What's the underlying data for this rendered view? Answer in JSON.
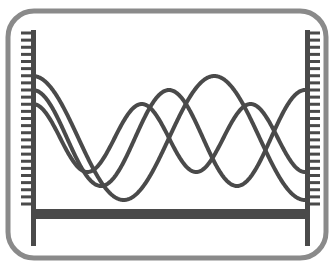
{
  "figure": {
    "title": "Standing wave modes between two fixed boundaries",
    "background_color": "#ffffff",
    "frame": {
      "name": "rounded-border-frame",
      "x": 8,
      "y": 11,
      "width": 318,
      "height": 247,
      "corner_radius": 26,
      "stroke_color": "#8a8a8a",
      "stroke_width": 5,
      "fill": "none"
    },
    "left_wall": {
      "label": "fixed boundary left",
      "bar_x": 31,
      "bar_top": 30,
      "bar_bottom": 246,
      "bar_width": 5,
      "color": "#4a4a4a",
      "hatch_side": "left",
      "hatch_count": 25,
      "hatch_length": 10,
      "hatch_thickness": 3,
      "hatch_top": 33,
      "hatch_bottom": 204
    },
    "right_wall": {
      "label": "fixed boundary right",
      "bar_x": 305,
      "bar_top": 30,
      "bar_bottom": 246,
      "bar_width": 5,
      "color": "#4a4a4a",
      "hatch_side": "right",
      "hatch_count": 25,
      "hatch_length": 10,
      "hatch_thickness": 3,
      "hatch_top": 33,
      "hatch_bottom": 204
    },
    "base_bar": {
      "label": "rigid base support",
      "x": 31,
      "y": 209,
      "width": 276,
      "height": 10,
      "color": "#4a4a4a"
    }
  },
  "chart_data": {
    "type": "line",
    "title": "Standing wave modes between two fixed boundaries",
    "xlabel": "",
    "ylabel": "",
    "xlim": [
      33,
      305
    ],
    "ylim": [
      70,
      210
    ],
    "grid": false,
    "legend": "none",
    "baseline_y": 138,
    "stroke_color": "#4a4a4a",
    "stroke_width": 4,
    "series": [
      {
        "name": "mode-1-three-half-wavelengths",
        "half_wavelengths": 3,
        "amplitude": 62,
        "start_y": 78,
        "phase": "cosine",
        "peaks_x": [
          35,
          168,
          303
        ],
        "troughs_x": [
          100,
          236
        ]
      },
      {
        "name": "mode-2-four-half-wavelengths",
        "half_wavelengths": 4,
        "amplitude": 48,
        "start_y": 92,
        "phase": "cosine",
        "peaks_x": [
          35,
          122,
          214,
          303
        ],
        "troughs_x": [
          80,
          168,
          258
        ]
      },
      {
        "name": "mode-3-five-half-wavelengths",
        "half_wavelengths": 5,
        "amplitude": 34,
        "start_y": 110,
        "phase": "cosine",
        "peaks_x": [
          35,
          143,
          250,
          303
        ],
        "troughs_x": [
          70,
          115,
          168,
          222,
          275
        ]
      }
    ]
  }
}
